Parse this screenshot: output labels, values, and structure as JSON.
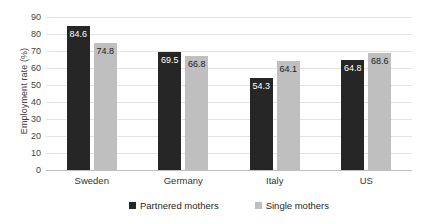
{
  "chart_data": {
    "type": "bar",
    "title": "",
    "subtitle": "",
    "xlabel": "",
    "ylabel": "Employment rate (%)",
    "ylim": [
      0,
      90
    ],
    "ytick_step": 10,
    "yticks": [
      90,
      80,
      70,
      60,
      50,
      40,
      30,
      20,
      10,
      0
    ],
    "categories": [
      "Sweden",
      "Germany",
      "Italy",
      "US"
    ],
    "series": [
      {
        "name": "Partnered mothers",
        "color": "#262626",
        "values": [
          84.6,
          69.5,
          54.3,
          64.8
        ],
        "labels": [
          "84.6",
          "69.5",
          "54.3",
          "64.8"
        ]
      },
      {
        "name": "Single mothers",
        "color": "#bfbfbf",
        "values": [
          74.8,
          66.8,
          64.1,
          68.6
        ],
        "labels": [
          "74.8",
          "66.8",
          "64.1",
          "68.6"
        ]
      }
    ],
    "grid": true,
    "grid_axis": "y",
    "legend_position": "bottom",
    "data_labels": true
  }
}
